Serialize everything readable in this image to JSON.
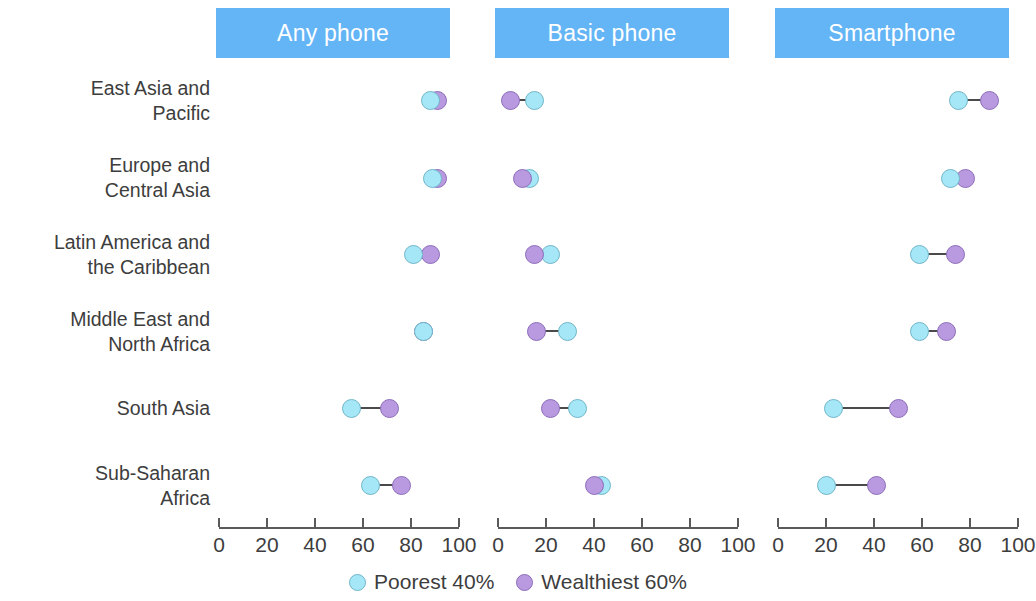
{
  "chart_data": {
    "type": "scatter",
    "title": "",
    "subtitle": "",
    "xlabel": "",
    "ylabel": "",
    "xlim": [
      0,
      100
    ],
    "grid": false,
    "legend_position": "bottom",
    "panels": [
      {
        "label": "Any phone"
      },
      {
        "label": "Basic phone"
      },
      {
        "label": "Smartphone"
      }
    ],
    "categories": [
      "East Asia and Pacific",
      "Europe and Central Asia",
      "Latin America and the Caribbean",
      "Middle East and North Africa",
      "South Asia",
      "Sub-Saharan Africa"
    ],
    "category_lines": [
      [
        "East Asia and",
        "Pacific"
      ],
      [
        "Europe and",
        "Central Asia"
      ],
      [
        "Latin America and",
        "the Caribbean"
      ],
      [
        "Middle East and",
        "North Africa"
      ],
      [
        "South Asia"
      ],
      [
        "Sub-Saharan",
        "Africa"
      ]
    ],
    "series": [
      {
        "name": "Poorest 40%",
        "color": "#a5e7f7"
      },
      {
        "name": "Wealthiest 60%",
        "color": "#b99ae0"
      }
    ],
    "values": {
      "Any phone": {
        "Poorest 40%": [
          88,
          89,
          81,
          85,
          55,
          63
        ],
        "Wealthiest 60%": [
          91,
          91,
          88,
          85,
          71,
          76
        ]
      },
      "Basic phone": {
        "Poorest 40%": [
          15,
          13,
          22,
          29,
          33,
          43
        ],
        "Wealthiest 60%": [
          5,
          10,
          15,
          16,
          22,
          40
        ]
      },
      "Smartphone": {
        "Poorest 40%": [
          75,
          72,
          59,
          59,
          23,
          20
        ],
        "Wealthiest 60%": [
          88,
          78,
          74,
          70,
          50,
          41
        ]
      }
    },
    "xticks": [
      0,
      20,
      40,
      60,
      80,
      100
    ],
    "xtick_labels": [
      "0",
      "20",
      "40",
      "60",
      "80",
      "100"
    ]
  }
}
